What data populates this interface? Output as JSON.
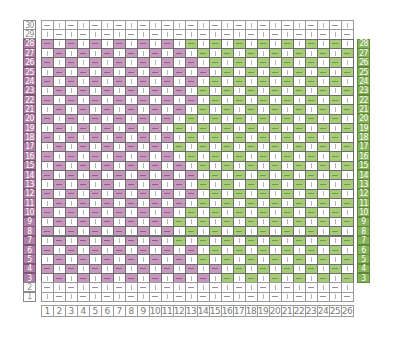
{
  "chart_data": {
    "type": "table",
    "title": "",
    "columns": 26,
    "rows": 30,
    "column_labels": [
      "1",
      "2",
      "3",
      "4",
      "5",
      "6",
      "7",
      "8",
      "9",
      "10",
      "11",
      "12",
      "13",
      "14",
      "15",
      "16",
      "17",
      "18",
      "19",
      "20",
      "21",
      "22",
      "23",
      "24",
      "25",
      "26"
    ],
    "colors": {
      "pink": "#c798bd",
      "green": "#a6cc78",
      "pink_label": "#b07fa6",
      "green_label": "#86b25a",
      "grid": "#6e6e6e"
    },
    "symbols": {
      "colored": "—",
      "plain": "|"
    },
    "row_data": [
      {
        "row": 30,
        "colored": false,
        "dash_parity": "odd",
        "first_green": null
      },
      {
        "row": 29,
        "colored": false,
        "dash_parity": "even",
        "first_green": null
      },
      {
        "row": 28,
        "colored": true,
        "dash_parity": "odd",
        "first_green": 13
      },
      {
        "row": 27,
        "colored": true,
        "dash_parity": "even",
        "first_green": 14
      },
      {
        "row": 26,
        "colored": true,
        "dash_parity": "odd",
        "first_green": 15
      },
      {
        "row": 25,
        "colored": true,
        "dash_parity": "even",
        "first_green": 16
      },
      {
        "row": 24,
        "colored": true,
        "dash_parity": "odd",
        "first_green": 15
      },
      {
        "row": 23,
        "colored": true,
        "dash_parity": "even",
        "first_green": 14
      },
      {
        "row": 22,
        "colored": true,
        "dash_parity": "odd",
        "first_green": 15
      },
      {
        "row": 21,
        "colored": true,
        "dash_parity": "even",
        "first_green": 14
      },
      {
        "row": 20,
        "colored": true,
        "dash_parity": "odd",
        "first_green": 13
      },
      {
        "row": 19,
        "colored": true,
        "dash_parity": "even",
        "first_green": 12
      },
      {
        "row": 18,
        "colored": true,
        "dash_parity": "odd",
        "first_green": 13
      },
      {
        "row": 17,
        "colored": true,
        "dash_parity": "even",
        "first_green": 12
      },
      {
        "row": 16,
        "colored": true,
        "dash_parity": "odd",
        "first_green": 13
      },
      {
        "row": 15,
        "colored": true,
        "dash_parity": "even",
        "first_green": 14
      },
      {
        "row": 14,
        "colored": true,
        "dash_parity": "odd",
        "first_green": 15
      },
      {
        "row": 13,
        "colored": true,
        "dash_parity": "even",
        "first_green": 14
      },
      {
        "row": 12,
        "colored": true,
        "dash_parity": "odd",
        "first_green": 15
      },
      {
        "row": 11,
        "colored": true,
        "dash_parity": "even",
        "first_green": 14
      },
      {
        "row": 10,
        "colored": true,
        "dash_parity": "odd",
        "first_green": 13
      },
      {
        "row": 9,
        "colored": true,
        "dash_parity": "even",
        "first_green": 12
      },
      {
        "row": 8,
        "colored": true,
        "dash_parity": "odd",
        "first_green": 13
      },
      {
        "row": 7,
        "colored": true,
        "dash_parity": "even",
        "first_green": 12
      },
      {
        "row": 6,
        "colored": true,
        "dash_parity": "odd",
        "first_green": 15
      },
      {
        "row": 5,
        "colored": true,
        "dash_parity": "even",
        "first_green": 14
      },
      {
        "row": 4,
        "colored": true,
        "dash_parity": "odd",
        "first_green": 17
      },
      {
        "row": 3,
        "colored": true,
        "dash_parity": "even",
        "first_green": 16
      },
      {
        "row": 2,
        "colored": false,
        "dash_parity": "odd",
        "first_green": null
      },
      {
        "row": 1,
        "colored": false,
        "dash_parity": "even",
        "first_green": null
      }
    ],
    "left_labels": {
      "pink_rows": [
        3,
        28
      ],
      "plain_rows": [
        1,
        2,
        29,
        30
      ]
    },
    "right_labels": {
      "green_rows": [
        3,
        28
      ]
    }
  },
  "layout": {
    "grid_left": 40.5,
    "grid_top": 20,
    "cell_w": 12,
    "cell_h": 9.37,
    "left_label_x": 23,
    "left_label_w": 13,
    "right_label_x": 357,
    "right_label_w": 13,
    "col_label_top": 305,
    "col_label_h": 12
  }
}
